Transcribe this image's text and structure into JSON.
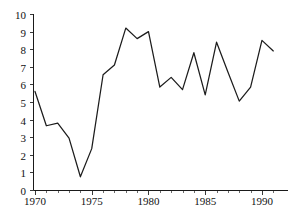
{
  "chart_data": {
    "type": "line",
    "title": "",
    "subtitle": "",
    "xlabel": "",
    "ylabel": "",
    "xlim": [
      1970,
      1991
    ],
    "ylim": [
      0,
      10
    ],
    "grid": false,
    "legend": false,
    "legend_position": "none",
    "line_color": "#1c1c1c",
    "axis_color": "#1a1a1a",
    "background_color": "#ffffff",
    "x": [
      1970,
      1971,
      1972,
      1973,
      1974,
      1975,
      1976,
      1977,
      1978,
      1979,
      1980,
      1981,
      1982,
      1983,
      1984,
      1985,
      1986,
      1987,
      1988,
      1989,
      1990,
      1991
    ],
    "values": [
      5.6,
      3.65,
      3.8,
      2.95,
      0.75,
      2.35,
      6.55,
      7.1,
      9.2,
      8.6,
      9.0,
      5.85,
      6.4,
      5.7,
      7.8,
      5.4,
      8.4,
      6.7,
      5.05,
      5.85,
      8.5,
      7.9
    ],
    "series": [
      {
        "name": "series-1",
        "values": [
          5.6,
          3.65,
          3.8,
          2.95,
          0.75,
          2.35,
          6.55,
          7.1,
          9.2,
          8.6,
          9.0,
          5.85,
          6.4,
          5.7,
          7.8,
          5.4,
          8.4,
          6.7,
          5.05,
          5.85,
          8.5,
          7.9
        ]
      }
    ],
    "y_ticks": [
      0,
      1,
      2,
      3,
      4,
      5,
      6,
      7,
      8,
      9,
      10
    ],
    "y_tick_labels": [
      "0",
      "1",
      "2",
      "3",
      "4",
      "5",
      "6",
      "7",
      "8",
      "9",
      "10"
    ],
    "x_ticks": [
      1970,
      1971,
      1972,
      1973,
      1974,
      1975,
      1976,
      1977,
      1978,
      1979,
      1980,
      1981,
      1982,
      1983,
      1984,
      1985,
      1986,
      1987,
      1988,
      1989,
      1990,
      1991
    ],
    "x_tick_labels_major": [
      "1970",
      "1975",
      "1980",
      "1985",
      "1990"
    ],
    "x_major_ticks": [
      1970,
      1975,
      1980,
      1985,
      1990
    ]
  }
}
